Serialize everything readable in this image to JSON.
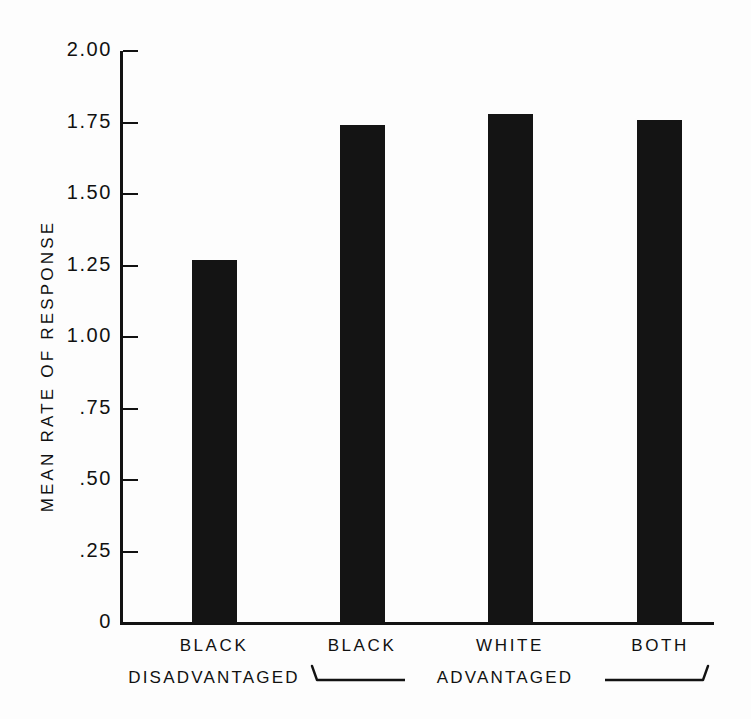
{
  "chart_data": {
    "type": "bar",
    "title": "",
    "xlabel": "",
    "ylabel": "MEAN RATE OF RESPONSE",
    "ylim": [
      0,
      2.0
    ],
    "yticks": [
      "0",
      ".25",
      ".50",
      ".75",
      "1.00",
      "1.25",
      "1.50",
      "1.75",
      "2.00"
    ],
    "ytick_values": [
      0,
      0.25,
      0.5,
      0.75,
      1.0,
      1.25,
      1.5,
      1.75,
      2.0
    ],
    "categories": [
      "BLACK",
      "BLACK",
      "WHITE",
      "BOTH"
    ],
    "values": [
      1.27,
      1.74,
      1.78,
      1.76
    ],
    "grid": false,
    "legend": null,
    "bar_color": "#141414",
    "axis_color": "#121212",
    "group_labels": [
      {
        "label": "DISADVANTAGED",
        "members": [
          "BLACK"
        ]
      },
      {
        "label": "ADVANTAGED",
        "members": [
          "BLACK",
          "WHITE",
          "BOTH"
        ]
      }
    ],
    "annotations": []
  },
  "axis": {
    "ylabel": "MEAN RATE OF RESPONSE",
    "ticks": [
      {
        "label": "2.00",
        "value": 2.0
      },
      {
        "label": "1.75",
        "value": 1.75
      },
      {
        "label": "1.50",
        "value": 1.5
      },
      {
        "label": "1.25",
        "value": 1.25
      },
      {
        "label": "1.00",
        "value": 1.0
      },
      {
        "label": ".75",
        "value": 0.75
      },
      {
        "label": ".50",
        "value": 0.5
      },
      {
        "label": ".25",
        "value": 0.25
      },
      {
        "label": "0",
        "value": 0
      }
    ]
  },
  "bars": [
    {
      "label": "BLACK",
      "value": 1.27
    },
    {
      "label": "BLACK",
      "value": 1.74
    },
    {
      "label": "WHITE",
      "value": 1.78
    },
    {
      "label": "BOTH",
      "value": 1.76
    }
  ],
  "groups": {
    "disadvantaged_label": "DISADVANTAGED",
    "advantaged_label": "ADVANTAGED"
  }
}
